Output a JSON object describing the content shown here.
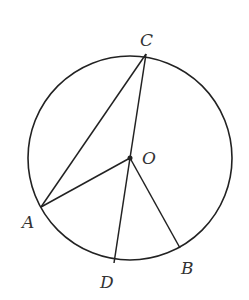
{
  "diagram": {
    "type": "circle-geometry",
    "circle": {
      "cx": 130,
      "cy": 158,
      "r": 102
    },
    "points": {
      "C": {
        "label": "C",
        "x": 146,
        "y": 54,
        "lx": 140,
        "ly": 46
      },
      "O": {
        "label": "O",
        "x": 130,
        "y": 158,
        "lx": 142,
        "ly": 164
      },
      "A": {
        "label": "A",
        "x": 41,
        "y": 207,
        "lx": 22,
        "ly": 228
      },
      "D": {
        "label": "D",
        "x": 114,
        "y": 263,
        "lx": 100,
        "ly": 288
      },
      "B": {
        "label": "B",
        "x": 180,
        "y": 248,
        "lx": 181,
        "ly": 274
      }
    },
    "segments": [
      "CA",
      "CO",
      "OA",
      "OD",
      "OB"
    ],
    "stroke_color": "#222222"
  }
}
